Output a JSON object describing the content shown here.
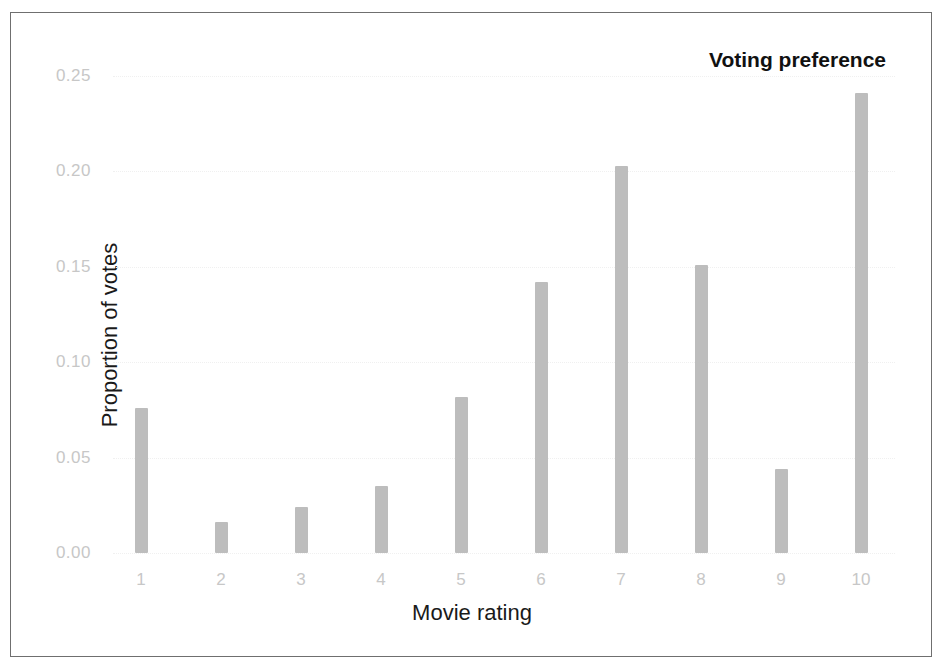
{
  "chart_data": {
    "type": "bar",
    "title": "Voting preference",
    "xlabel": "Movie rating",
    "ylabel": "Proportion of votes",
    "categories": [
      "1",
      "2",
      "3",
      "4",
      "5",
      "6",
      "7",
      "8",
      "9",
      "10"
    ],
    "values": [
      0.076,
      0.016,
      0.024,
      0.035,
      0.082,
      0.142,
      0.203,
      0.151,
      0.044,
      0.241
    ],
    "ylim": [
      0.0,
      0.2688
    ],
    "yticks": [
      0.0,
      0.05,
      0.1,
      0.15,
      0.2,
      0.25
    ],
    "ytick_labels": [
      "0.00",
      "0.05",
      "0.10",
      "0.15",
      "0.20",
      "0.25"
    ],
    "xtick_labels": [
      "1",
      "2",
      "3",
      "4",
      "5",
      "6",
      "7",
      "8",
      "9",
      "10"
    ],
    "grid": true,
    "legend": false,
    "bar_color": "#bdbdbd",
    "grid_color": "#f0f0f0",
    "tick_label_color": "#c7c7c7",
    "axis_title_color": "#1a1a1a",
    "title_color": "#111111",
    "frame_color": "#6f6f6f",
    "background": "#ffffff"
  }
}
